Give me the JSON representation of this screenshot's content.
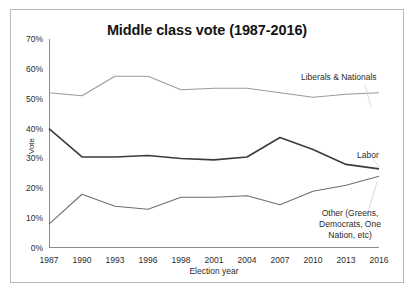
{
  "chart_data": {
    "type": "line",
    "title": "Middle class vote (1987-2016)",
    "xlabel": "Election year",
    "ylabel": "Vote",
    "categories": [
      "1987",
      "1990",
      "1993",
      "1996",
      "1998",
      "2001",
      "2004",
      "2007",
      "2010",
      "2013",
      "2016"
    ],
    "ylim": [
      0,
      70
    ],
    "ytick_labels": [
      "70%",
      "60%",
      "50%",
      "40%",
      "30%",
      "20%",
      "10%",
      "0%"
    ],
    "ytick_values": [
      70,
      60,
      50,
      40,
      30,
      20,
      10,
      0
    ],
    "grid": false,
    "legend_position": "in-plot annotations",
    "series": [
      {
        "name": "Liberals & Nationals",
        "label_text": "Liberals & Nationals",
        "color": "#9a9a9a",
        "width": 1.1,
        "values": [
          52.0,
          51.0,
          57.5,
          57.5,
          53.0,
          53.5,
          53.5,
          52.0,
          50.5,
          51.5,
          52.0
        ]
      },
      {
        "name": "Labor",
        "label_text": "Labor",
        "color": "#3b3b3b",
        "width": 1.6,
        "values": [
          40.0,
          30.5,
          30.5,
          31.0,
          30.0,
          29.5,
          30.5,
          37.0,
          33.0,
          28.0,
          26.5
        ]
      },
      {
        "name": "Other (Greens, Democrats, One Nation, etc)",
        "label_text": "Other (Greens,\nDemocrats, One\nNation, etc)",
        "color": "#6e6e6e",
        "width": 1.1,
        "values": [
          8.0,
          18.0,
          14.0,
          13.0,
          17.0,
          17.0,
          17.5,
          14.5,
          19.0,
          21.0,
          24.0
        ]
      }
    ]
  }
}
